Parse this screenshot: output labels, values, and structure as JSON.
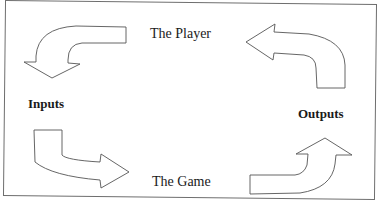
{
  "diagram": {
    "type": "cycle",
    "nodes": {
      "top": "The Player",
      "bottom": "The Game",
      "left": "Inputs",
      "right": "Outputs"
    },
    "edges": [
      {
        "from": "The Player",
        "to": "Inputs",
        "direction": "counter-clockwise"
      },
      {
        "from": "Inputs",
        "to": "The Game",
        "direction": "counter-clockwise"
      },
      {
        "from": "The Game",
        "to": "Outputs",
        "direction": "counter-clockwise"
      },
      {
        "from": "Outputs",
        "to": "The Player",
        "direction": "counter-clockwise"
      }
    ],
    "colors": {
      "stroke": "#555555",
      "fill": "#ffffff",
      "border": "#6e6e6e"
    }
  }
}
